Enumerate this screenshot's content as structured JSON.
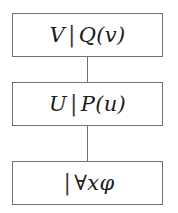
{
  "diagram": {
    "type": "vertical-chain",
    "orientation": "top-to-bottom",
    "border_color": "#6f6f6f",
    "background_color": "#ffffff",
    "text_color": "#1b1b1b",
    "nodes": [
      {
        "id": "node-1",
        "position": "top",
        "left_part": "V",
        "separator": "|",
        "right_part": "Q(v)",
        "full_text": "V | Q(v)"
      },
      {
        "id": "node-2",
        "position": "middle",
        "left_part": "U",
        "separator": "|",
        "right_part": "P(u)",
        "full_text": "U | P(u)"
      },
      {
        "id": "node-3",
        "position": "bottom",
        "left_part": "",
        "separator": "|",
        "right_part": "∀xφ",
        "quantifier": "∀",
        "variable": "x",
        "formula": "φ",
        "full_text": "| ∀xφ"
      }
    ],
    "connectors": [
      {
        "id": "connector-1",
        "from": "node-1",
        "to": "node-2"
      },
      {
        "id": "connector-2",
        "from": "node-2",
        "to": "node-3"
      }
    ]
  }
}
